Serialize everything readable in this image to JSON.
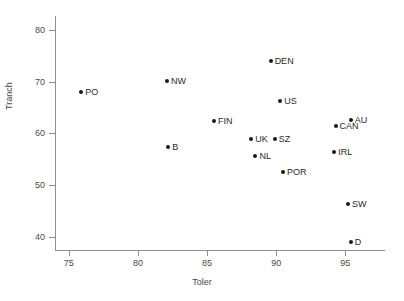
{
  "chart_data": {
    "type": "scatter",
    "title": "",
    "xlabel": "Toler",
    "ylabel": "Tranch",
    "xlim": [
      74.0,
      96.5
    ],
    "ylim": [
      37.5,
      81.5
    ],
    "xticks": [
      75,
      80,
      85,
      90,
      95
    ],
    "yticks": [
      40,
      50,
      60,
      70,
      80
    ],
    "grid": false,
    "legend": "none",
    "points": [
      {
        "label": "PO",
        "x": 75.9,
        "y": 68.0,
        "label_pos": "right"
      },
      {
        "label": "NW",
        "x": 82.1,
        "y": 70.2,
        "label_pos": "right"
      },
      {
        "label": "B",
        "x": 82.2,
        "y": 57.3,
        "label_pos": "right"
      },
      {
        "label": "FIN",
        "x": 85.5,
        "y": 62.3,
        "label_pos": "right"
      },
      {
        "label": "UK",
        "x": 88.2,
        "y": 59.0,
        "label_pos": "right"
      },
      {
        "label": "NL",
        "x": 88.5,
        "y": 55.6,
        "label_pos": "right"
      },
      {
        "label": "DEN",
        "x": 89.6,
        "y": 74.0,
        "label_pos": "right"
      },
      {
        "label": "SZ",
        "x": 89.9,
        "y": 59.0,
        "label_pos": "right"
      },
      {
        "label": "US",
        "x": 90.3,
        "y": 66.3,
        "label_pos": "right"
      },
      {
        "label": "POR",
        "x": 90.5,
        "y": 52.5,
        "label_pos": "right"
      },
      {
        "label": "CAN",
        "x": 94.3,
        "y": 61.5,
        "label_pos": "right"
      },
      {
        "label": "AU",
        "x": 95.4,
        "y": 62.5,
        "label_pos": "right"
      },
      {
        "label": "IRL",
        "x": 94.2,
        "y": 56.5,
        "label_pos": "right"
      },
      {
        "label": "SW",
        "x": 95.2,
        "y": 46.3,
        "label_pos": "right"
      },
      {
        "label": "D",
        "x": 95.4,
        "y": 39.0,
        "label_pos": "right"
      }
    ]
  },
  "colors": {
    "marker": "#1a1a1a",
    "axis": "#8e8e8e",
    "text": "#4a4a4a",
    "background": "#ffffff"
  }
}
